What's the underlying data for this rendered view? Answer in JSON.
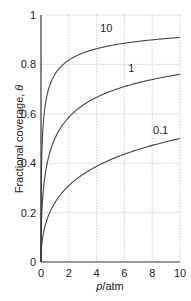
{
  "chart_data": {
    "type": "line",
    "title": "",
    "xlabel_italic": "p",
    "xlabel_rest": "/atm",
    "ylabel_text": "Fractional coverage, ",
    "ylabel_symbol": "θ",
    "xlim": [
      0,
      10
    ],
    "ylim": [
      0,
      1
    ],
    "grid": true,
    "legend": "inline curve labels",
    "x_ticks": [
      "0",
      "2",
      "4",
      "6",
      "8",
      "10"
    ],
    "y_ticks": [
      "0",
      "0.2",
      "0.4",
      "0.6",
      "0.8",
      "1"
    ],
    "x": [
      0,
      0.5,
      1,
      2,
      3,
      4,
      5,
      6,
      7,
      8,
      9,
      10
    ],
    "series": [
      {
        "name": "10",
        "values": [
          0,
          0.69,
          0.76,
          0.82,
          0.85,
          0.86,
          0.88,
          0.89,
          0.89,
          0.9,
          0.9,
          0.91
        ]
      },
      {
        "name": "1",
        "values": [
          0,
          0.41,
          0.5,
          0.59,
          0.63,
          0.67,
          0.69,
          0.71,
          0.73,
          0.74,
          0.75,
          0.76
        ]
      },
      {
        "name": "0.1",
        "values": [
          0,
          0.18,
          0.24,
          0.31,
          0.35,
          0.39,
          0.41,
          0.44,
          0.46,
          0.47,
          0.49,
          0.5
        ]
      }
    ],
    "curve_labels": [
      {
        "text": "10",
        "x": 4.7,
        "y": 0.93
      },
      {
        "text": "1",
        "x": 6.5,
        "y": 0.77
      },
      {
        "text": "0.1",
        "x": 8.6,
        "y": 0.52
      }
    ]
  }
}
